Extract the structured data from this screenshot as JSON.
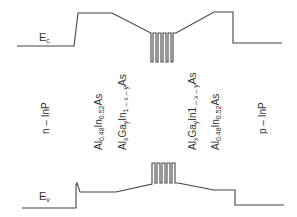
{
  "diagram": {
    "type": "band-diagram",
    "bands": {
      "conduction": {
        "label_main": "E",
        "label_sub": "c"
      },
      "valence": {
        "label_main": "E",
        "label_sub": "v"
      }
    },
    "layers": [
      {
        "id": "n-inp",
        "label": "n – InP"
      },
      {
        "id": "alinas-left",
        "parts": [
          "Al",
          "0.48",
          "In",
          "0.52",
          "As"
        ]
      },
      {
        "id": "algainas-left",
        "parts": [
          "Al",
          "x",
          "Ga",
          "y",
          "In",
          "1 – x – y",
          "As"
        ]
      },
      {
        "id": "mqw",
        "wells": 5
      },
      {
        "id": "algainas-right",
        "parts": [
          "Al",
          "x",
          "Ga",
          "y",
          "In1",
          " – x – y",
          "As"
        ]
      },
      {
        "id": "alinas-right",
        "parts": [
          "Al",
          "0.48",
          "In",
          "0.52",
          "As"
        ]
      },
      {
        "id": "p-inp",
        "label": "p – InP"
      }
    ],
    "colors": {
      "line": "#444444",
      "text": "#333333"
    }
  }
}
